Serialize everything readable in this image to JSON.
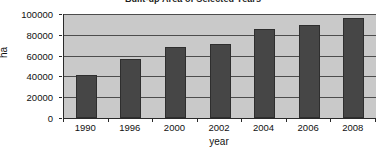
{
  "chart_data": {
    "type": "bar",
    "title": "Built-up Area of Selected Years",
    "xlabel": "year",
    "ylabel": "ha",
    "categories": [
      "1990",
      "1996",
      "2000",
      "2002",
      "2004",
      "2006",
      "2008"
    ],
    "values": [
      41500,
      56500,
      68000,
      71500,
      85500,
      89000,
      96000
    ],
    "ylim": [
      0,
      100000
    ],
    "ytick_labels": [
      "0",
      "20000",
      "40000",
      "60000",
      "80000",
      "100000"
    ],
    "ytick_values": [
      0,
      20000,
      40000,
      60000,
      80000,
      100000
    ],
    "grid": true,
    "legend": false,
    "colors": {
      "bar_fill": "#464646",
      "bar_edge": "#2e2e2e",
      "plot_background": "#c9c9c9",
      "gridline": "#4d4d4d",
      "axis": "#2a2a2a",
      "text": "#111111",
      "page_background": "#ffffff"
    }
  }
}
